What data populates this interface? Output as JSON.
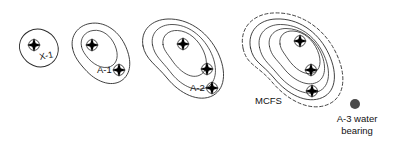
{
  "figure": {
    "type": "contour-map",
    "background_color": "#ffffff",
    "line_color": "#2b2b2b",
    "dashed_line_color": "#3a3a3a",
    "well_symbol_color": "#000000",
    "legend_dot_color": "#4a4a4a"
  },
  "structures": [
    {
      "id": "x-1",
      "label": "X-1",
      "label_x": 40,
      "label_y": 60,
      "label_rotation": -12,
      "contour_count": 1,
      "boundary_style": "solid",
      "wells": [
        {
          "x": 34,
          "y": 45
        }
      ]
    },
    {
      "id": "a-1",
      "label": "A-1",
      "label_x": 97,
      "label_y": 73,
      "label_rotation": 0,
      "contour_count": 2,
      "boundary_style": "solid",
      "wells": [
        {
          "x": 92,
          "y": 45
        },
        {
          "x": 119,
          "y": 70
        }
      ]
    },
    {
      "id": "a-2",
      "label": "A-2",
      "label_x": 190,
      "label_y": 91,
      "label_rotation": 0,
      "contour_count": 3,
      "boundary_style": "solid",
      "wells": [
        {
          "x": 183,
          "y": 44
        },
        {
          "x": 207,
          "y": 69
        },
        {
          "x": 212,
          "y": 88
        }
      ]
    },
    {
      "id": "mcfs",
      "label": "MCFS",
      "label_x": 255,
      "label_y": 104,
      "label_rotation": 0,
      "contour_count": 4,
      "boundary_style": "dashed",
      "wells": [
        {
          "x": 300,
          "y": 41
        },
        {
          "x": 311,
          "y": 70
        },
        {
          "x": 312,
          "y": 91
        }
      ]
    }
  ],
  "legend": {
    "marker_x": 355,
    "marker_y": 104,
    "marker_radius": 5,
    "label_line_1": "A-3 water",
    "label_line_2": "bearing",
    "label_x": 357,
    "label_line_1_y": 122,
    "label_line_2_y": 134
  }
}
